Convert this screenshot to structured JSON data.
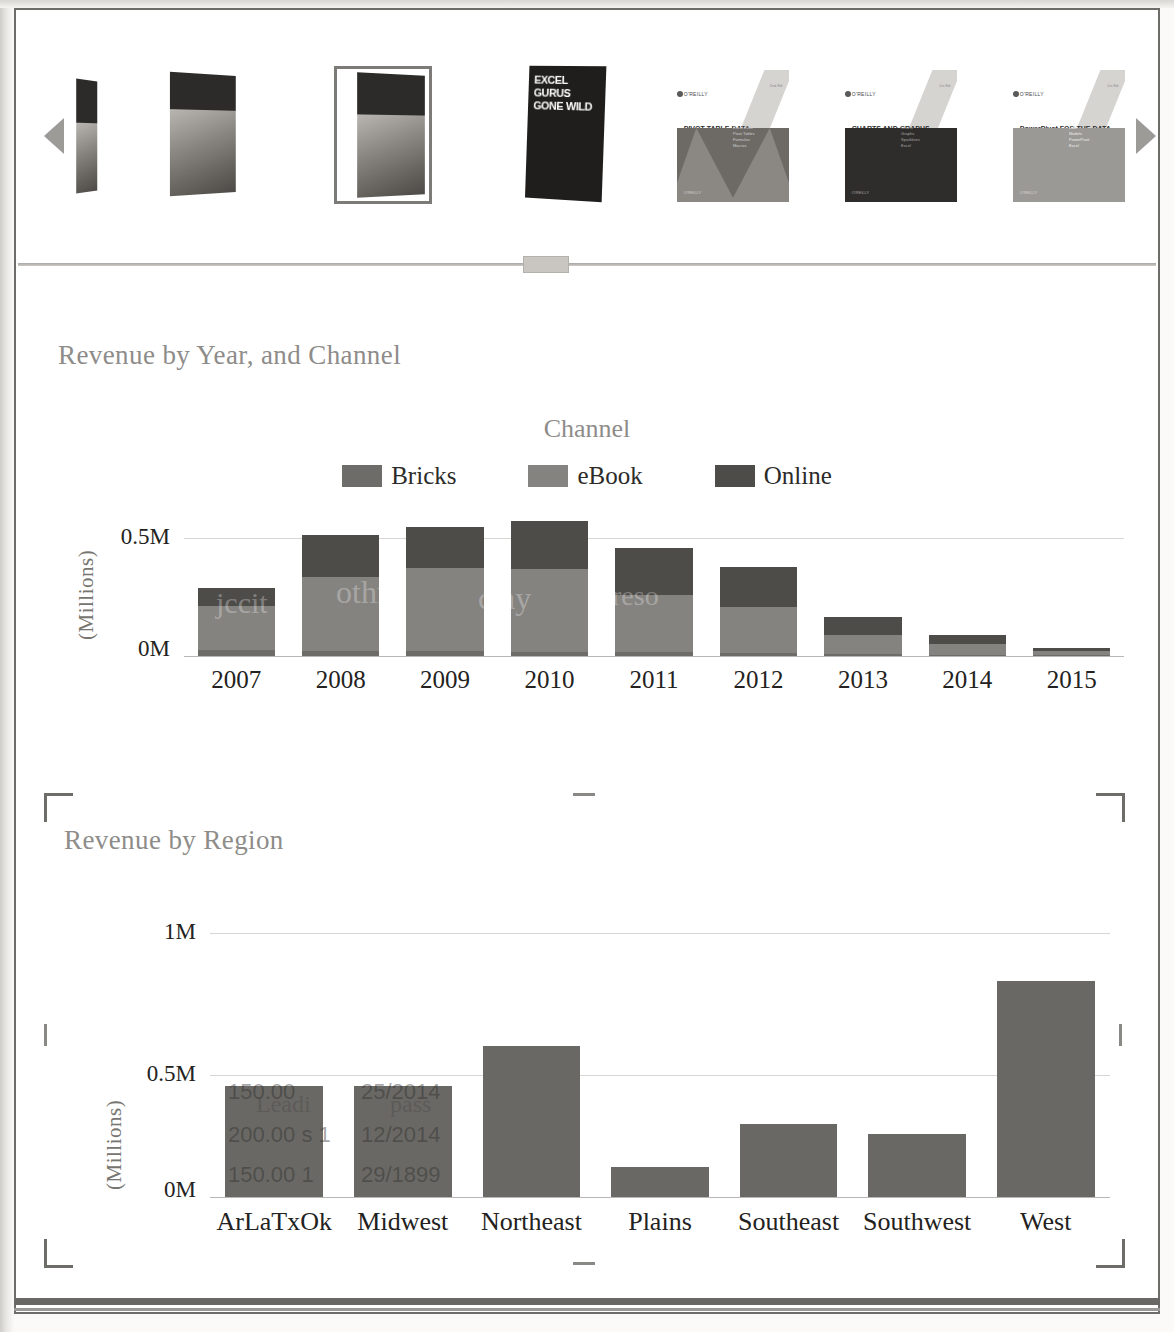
{
  "window": {
    "carousel": {
      "prev_label": "◀",
      "next_label": "▶",
      "selected_index": 2,
      "books": [
        {
          "name": "book-1",
          "title": "Excel Gurus Gone Wild",
          "publisher": "",
          "edition": "",
          "type": "photo",
          "selected": false
        },
        {
          "name": "book-2",
          "title": "Pivot Table Data Crunching",
          "publisher": "",
          "edition": "",
          "type": "photo",
          "selected": false
        },
        {
          "name": "book-3",
          "title": "Excel 2010 In Depth",
          "publisher": "",
          "edition": "",
          "type": "photo",
          "selected": true
        },
        {
          "name": "book-4",
          "title": "EXCEL GURUS GONE WILD",
          "publisher": "",
          "edition": "",
          "type": "photo",
          "selected": false
        },
        {
          "name": "book-5",
          "title": "PIVOT TABLE DATA CRUNCHING",
          "publisher": "O'REILLY",
          "edition": "2nd Ed",
          "type": "oreilly",
          "selected": false
        },
        {
          "name": "book-6",
          "title": "CHARTS AND GRAPHS",
          "publisher": "O'REILLY",
          "edition": "1st Ed",
          "type": "oreilly",
          "selected": false
        },
        {
          "name": "book-7",
          "title": "PowerPivot FOR THE DATA ANALYST",
          "publisher": "O'REILLY",
          "edition": "1st Ed",
          "type": "oreilly",
          "selected": false
        }
      ]
    },
    "splitter": {
      "name": "horizontal-splitter",
      "grip_label": ""
    }
  },
  "chart_data": [
    {
      "id": "revenue-by-year-channel",
      "type": "bar",
      "stacked": true,
      "title": "Revenue by Year, and Channel",
      "legend_title": "Channel",
      "legend_position": "top",
      "xlabel": "",
      "ylabel": "(Millions)",
      "ylim": [
        0,
        0.58
      ],
      "yticks": [
        0,
        0.5
      ],
      "ytick_labels": [
        "0M",
        "0.5M"
      ],
      "grid": true,
      "categories": [
        "2007",
        "2008",
        "2009",
        "2010",
        "2011",
        "2012",
        "2013",
        "2014",
        "2015"
      ],
      "series": [
        {
          "name": "Bricks",
          "color": "#6e6c68",
          "values": [
            0.022,
            0.02,
            0.018,
            0.016,
            0.014,
            0.01,
            0.008,
            0.006,
            0.004
          ]
        },
        {
          "name": "eBook",
          "color": "#85837f",
          "values": [
            0.175,
            0.295,
            0.33,
            0.33,
            0.23,
            0.185,
            0.075,
            0.04,
            0.016
          ]
        },
        {
          "name": "Online",
          "color": "#4e4c49",
          "values": [
            0.073,
            0.165,
            0.165,
            0.19,
            0.185,
            0.16,
            0.072,
            0.037,
            0.012
          ]
        }
      ],
      "totals": [
        0.27,
        0.48,
        0.513,
        0.536,
        0.429,
        0.355,
        0.155,
        0.083,
        0.032
      ]
    },
    {
      "id": "revenue-by-region",
      "type": "bar",
      "stacked": false,
      "title": "Revenue by Region",
      "xlabel": "",
      "ylabel": "(Millions)",
      "ylim": [
        0,
        1.05
      ],
      "yticks": [
        0,
        0.5,
        1.0
      ],
      "ytick_labels": [
        "0M",
        "0.5M",
        "1M"
      ],
      "grid": true,
      "categories": [
        "ArLaTxOk",
        "Midwest",
        "Northeast",
        "Plains",
        "Southeast",
        "Southwest",
        "West"
      ],
      "values": [
        0.44,
        0.44,
        0.6,
        0.12,
        0.29,
        0.25,
        0.86
      ],
      "bar_color": "#6a6864",
      "selected": true
    }
  ],
  "bleed_through": {
    "chart1": [
      "jcca",
      "jothn",
      "chay",
      "reso",
      "pom"
    ],
    "chart2_col1": [
      "150.00",
      "Leadi",
      "200.00 s 1",
      "150.00  1"
    ],
    "chart2_col2": [
      "25/2014",
      "pass",
      "12/2014",
      "29/1899"
    ]
  }
}
